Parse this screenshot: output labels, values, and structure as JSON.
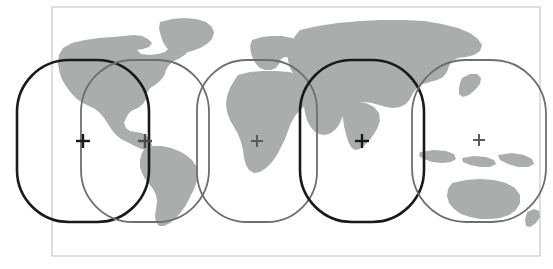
{
  "figure": {
    "type": "map-diagram",
    "width": 553,
    "height": 269,
    "background_color": "#ffffff"
  },
  "frame": {
    "name": "map-frame",
    "x": 52,
    "y": 7,
    "width": 488,
    "height": 249,
    "stroke_color": "#c9c9c9",
    "stroke_width": 1.2,
    "fill_color": "#ffffff"
  },
  "map": {
    "landmass_color": "#abacac",
    "ocean_color": "#ffffff",
    "projection_note": "equirectangular world map",
    "continents": [
      "north-america",
      "greenland",
      "south-america",
      "europe",
      "africa",
      "asia",
      "australia",
      "indonesia",
      "japan",
      "new-zealand"
    ]
  },
  "footprints": [
    {
      "id": 1,
      "name": "footprint-1",
      "cx": 83,
      "cy": 141,
      "rx": 66,
      "ry": 81,
      "corner_r": 52,
      "stroke_color": "#1a1a1a",
      "stroke_width": 2.6,
      "emphasis": "primary"
    },
    {
      "id": 2,
      "name": "footprint-2",
      "cx": 145,
      "cy": 141,
      "rx": 64,
      "ry": 81,
      "corner_r": 52,
      "stroke_color": "#6e6e6e",
      "stroke_width": 1.8,
      "emphasis": "secondary"
    },
    {
      "id": 3,
      "name": "footprint-3",
      "cx": 257,
      "cy": 141,
      "rx": 60,
      "ry": 81,
      "corner_r": 50,
      "stroke_color": "#6e6e6e",
      "stroke_width": 1.8,
      "emphasis": "secondary"
    },
    {
      "id": 4,
      "name": "footprint-4",
      "cx": 362,
      "cy": 141,
      "rx": 62,
      "ry": 81,
      "corner_r": 52,
      "stroke_color": "#1a1a1a",
      "stroke_width": 2.6,
      "emphasis": "primary"
    },
    {
      "id": 5,
      "name": "footprint-5",
      "cx": 479,
      "cy": 141,
      "rx": 67,
      "ry": 81,
      "corner_r": 54,
      "stroke_color": "#6e6e6e",
      "stroke_width": 1.8,
      "emphasis": "secondary"
    }
  ],
  "center_markers": [
    {
      "name": "center-marker-1",
      "x": 83,
      "y": 141,
      "size": 7,
      "stroke_color": "#1a1a1a",
      "stroke_width": 2.4
    },
    {
      "name": "center-marker-2",
      "x": 145,
      "y": 141,
      "size": 7,
      "stroke_color": "#4a4a4a",
      "stroke_width": 2.4
    },
    {
      "name": "center-marker-3",
      "x": 257,
      "y": 141,
      "size": 6,
      "stroke_color": "#5a5a5a",
      "stroke_width": 2.0
    },
    {
      "name": "center-marker-4",
      "x": 362,
      "y": 141,
      "size": 7,
      "stroke_color": "#1a1a1a",
      "stroke_width": 2.4
    },
    {
      "name": "center-marker-5",
      "x": 479,
      "y": 140,
      "size": 6,
      "stroke_color": "#5a5a5a",
      "stroke_width": 2.0
    }
  ],
  "land_shapes": {
    "north_america": "M 63 48 L 72 43 L 85 40 L 99 38 L 112 37 L 124 36 L 134 35 L 142 36 L 148 39 L 152 43 L 149 47 L 143 49 L 137 50 L 141 54 L 150 55 L 158 54 L 165 52 L 168 49 L 173 46 L 180 44 L 186 45 L 189 49 L 186 54 L 180 58 L 174 61 L 169 65 L 166 70 L 164 76 L 160 81 L 155 85 L 150 88 L 147 93 L 146 99 L 143 104 L 138 108 L 133 110 L 129 113 L 126 118 L 124 123 L 126 128 L 130 131 L 136 132 L 142 133 L 147 136 L 150 140 L 152 145 L 150 149 L 145 150 L 139 148 L 133 145 L 127 142 L 121 139 L 116 135 L 112 130 L 108 124 L 104 118 L 100 113 L 95 109 L 89 106 L 83 103 L 77 99 L 72 94 L 68 89 L 64 83 L 61 77 L 59 70 L 58 63 L 59 55 Z",
    "greenland": "M 160 22 L 172 19 L 184 18 L 196 19 L 206 22 L 212 27 L 214 33 L 212 39 L 207 44 L 200 48 L 192 51 L 184 53 L 176 53 L 170 51 L 166 47 L 163 42 L 161 36 L 159 29 Z",
    "south_america": "M 145 148 L 153 146 L 162 146 L 171 148 L 179 151 L 186 155 L 192 160 L 196 166 L 198 173 L 197 181 L 194 189 L 190 197 L 186 205 L 181 212 L 176 218 L 170 223 L 164 226 L 159 226 L 156 222 L 155 216 L 156 209 L 157 202 L 156 195 L 153 189 L 149 184 L 145 179 L 142 173 L 140 167 L 140 160 L 142 153 Z",
    "europe": "M 252 40 L 262 37 L 272 36 L 282 36 L 292 38 L 300 41 L 306 45 L 309 50 L 307 55 L 302 58 L 296 59 L 290 58 L 285 57 L 281 59 L 279 64 L 276 68 L 271 70 L 265 70 L 260 68 L 256 64 L 253 59 L 251 53 L 250 46 Z",
    "africa": "M 238 75 L 250 72 L 263 71 L 276 71 L 289 72 L 300 75 L 308 79 L 313 85 L 314 92 L 311 99 L 306 105 L 300 110 L 295 116 L 291 123 L 288 131 L 285 139 L 281 147 L 277 155 L 272 162 L 266 168 L 260 172 L 254 173 L 249 170 L 246 165 L 244 158 L 243 150 L 241 142 L 238 134 L 234 127 L 230 120 L 227 112 L 226 104 L 227 96 L 230 88 L 234 81 Z",
    "asia": "M 300 30 L 318 26 L 338 23 L 360 21 L 382 20 L 404 20 L 424 21 L 442 24 L 458 28 L 470 33 L 478 39 L 482 45 L 480 51 L 474 55 L 466 57 L 458 58 L 452 61 L 449 66 L 447 72 L 443 77 L 437 80 L 430 82 L 423 84 L 417 88 L 413 93 L 410 99 L 406 104 L 400 107 L 393 108 L 386 107 L 379 105 L 372 103 L 365 102 L 358 103 L 352 106 L 347 110 L 343 116 L 340 123 L 336 129 L 331 133 L 325 135 L 319 134 L 314 131 L 310 126 L 307 120 L 305 113 L 304 106 L 303 98 L 301 90 L 298 82 L 294 75 L 290 68 L 288 60 L 288 52 L 291 44 L 295 36 Z",
    "india": "M 345 104 L 356 102 L 366 103 L 374 107 L 379 113 L 380 121 L 377 129 L 372 137 L 366 144 L 360 149 L 355 150 L 351 147 L 348 141 L 346 134 L 344 126 L 343 118 L 343 110 Z",
    "australia": "M 452 183 L 466 180 L 480 179 L 494 180 L 506 183 L 515 188 L 520 195 L 520 203 L 516 210 L 509 215 L 500 218 L 490 219 L 480 219 L 470 217 L 461 214 L 454 209 L 449 203 L 447 196 L 448 189 Z",
    "indonesia_1": "M 420 152 L 434 150 L 446 151 L 454 154 L 456 159 L 451 162 L 442 163 L 432 162 L 424 159 L 419 156 Z",
    "indonesia_2": "M 462 158 L 474 156 L 486 157 L 494 160 L 496 164 L 490 167 L 480 167 L 470 165 L 463 162 Z",
    "new_guinea": "M 498 155 L 512 153 L 524 155 L 532 159 L 534 164 L 528 167 L 518 167 L 508 164 L 500 160 Z",
    "japan": "M 462 78 L 470 74 L 477 74 L 481 78 L 480 84 L 475 90 L 469 95 L 463 97 L 459 94 L 459 88 L 460 83 Z",
    "new_zealand": "M 527 212 L 534 209 L 539 211 L 540 217 L 536 223 L 530 227 L 526 226 L 525 220 Z"
  }
}
